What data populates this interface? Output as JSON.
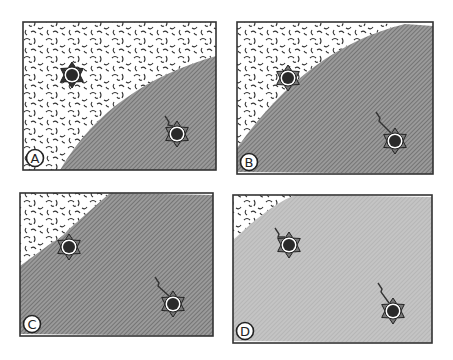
{
  "figure": {
    "panels": [
      {
        "id": "A",
        "label": "A",
        "box": {
          "x": 23,
          "y": 22,
          "w": 193,
          "h": 148
        },
        "region_light": "M23,22 L216,22 L216,56 C150,75 95,110 60,170 L23,170 Z",
        "region_dark": "M216,56 C150,75 95,110 60,170 L216,170 Z",
        "dark_fill": "#8a8a8a",
        "stars": [
          {
            "cx": 72,
            "cy": 75,
            "tail": false,
            "style": "dark"
          },
          {
            "cx": 177,
            "cy": 134,
            "tail": true,
            "tail_from": [
              165,
              116
            ],
            "style": "ring"
          }
        ]
      },
      {
        "id": "B",
        "label": "B",
        "box": {
          "x": 237,
          "y": 22,
          "w": 196,
          "h": 152
        },
        "region_light": "M237,22 L405,24 C340,40 285,80 237,148 Z",
        "region_dark": "M405,24 L433,26 L433,174 L237,172 L237,148 C285,80 340,40 405,24 Z",
        "dark_fill": "#8a8a8a",
        "stars": [
          {
            "cx": 288,
            "cy": 78,
            "tail": false,
            "style": "ring"
          },
          {
            "cx": 395,
            "cy": 141,
            "tail": true,
            "tail_from": [
              376,
              112
            ],
            "style": "ring"
          }
        ]
      },
      {
        "id": "C",
        "label": "C",
        "box": {
          "x": 20,
          "y": 193,
          "w": 193,
          "h": 143
        },
        "region_light": "M20,193 L110,193 L68,230 C62,238 55,240 46,247 L20,266 Z",
        "region_dark": "M110,193 L213,195 L213,336 L20,334 L20,266 L46,247 C55,240 62,238 68,230 Z",
        "dark_fill": "#8a8a8a",
        "stars": [
          {
            "cx": 69,
            "cy": 247,
            "tail": false,
            "style": "ring"
          },
          {
            "cx": 173,
            "cy": 304,
            "tail": true,
            "tail_from": [
              155,
              277
            ],
            "style": "ring"
          }
        ]
      },
      {
        "id": "D",
        "label": "D",
        "box": {
          "x": 233,
          "y": 195,
          "w": 199,
          "h": 148
        },
        "region_light": "M233,195 L295,195 C270,205 250,225 233,240 Z",
        "region_dark": "M295,195 L432,197 L432,343 L233,341 L233,240 C250,225 270,205 295,195 Z",
        "dark_fill": "#bdbdbd",
        "stars": [
          {
            "cx": 289,
            "cy": 245,
            "tail": true,
            "tail_from": [
              275,
              228
            ],
            "style": "ring"
          },
          {
            "cx": 393,
            "cy": 311,
            "tail": true,
            "tail_from": [
              378,
              283
            ],
            "style": "ring"
          }
        ]
      }
    ]
  }
}
